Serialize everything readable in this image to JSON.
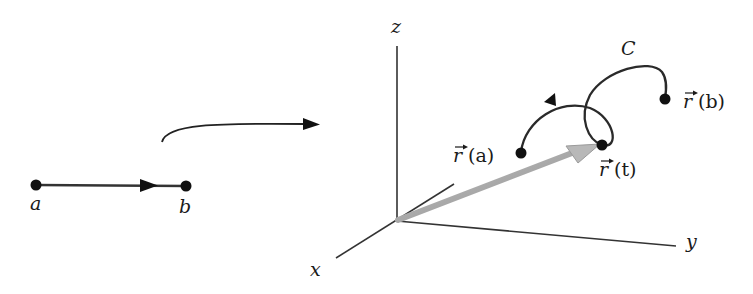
{
  "figure": {
    "colors": {
      "ink": "#1a1a1a",
      "vector": "#a8a8a8",
      "vector_tip": "#bcbcbc"
    },
    "interval": {
      "start_label": "a",
      "end_label": "b"
    },
    "mapping_arrow": "map-arrow",
    "axes": {
      "x_label": "x",
      "y_label": "y",
      "z_label": "z"
    },
    "curve": {
      "name_label": "C",
      "start_label_vec": "r",
      "start_label_arg": "(a)",
      "point_label_vec": "r",
      "point_label_arg": "(t)",
      "end_label_vec": "r",
      "end_label_arg": "(b)"
    }
  }
}
